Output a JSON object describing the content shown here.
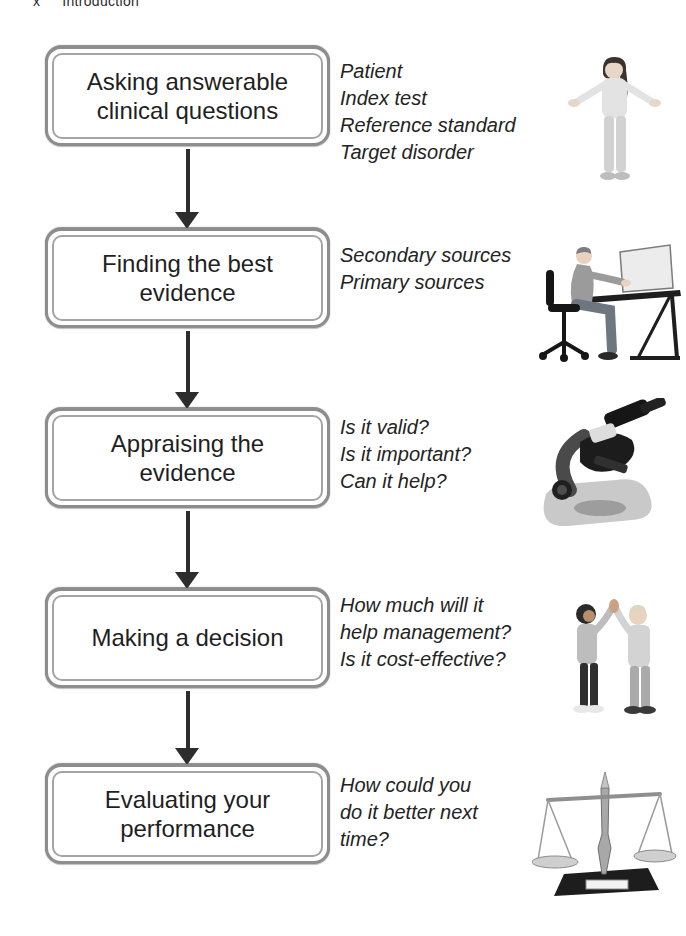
{
  "page": {
    "header": {
      "page_number": "x",
      "title": "Introduction"
    }
  },
  "flowchart": {
    "steps": [
      {
        "label": "Asking answerable\nclinical questions",
        "note": "Patient\nIndex test\nReference standard\nTarget disorder",
        "image": "girl-shrugging"
      },
      {
        "label": "Finding the best\nevidence",
        "note": "Secondary sources\nPrimary sources",
        "image": "person-at-computer"
      },
      {
        "label": "Appraising the\nevidence",
        "note": "Is it valid?\nIs it important?\nCan it help?",
        "image": "microscope"
      },
      {
        "label": "Making a decision",
        "note": "How much will it\nhelp management?\nIs it cost-effective?",
        "image": "children-high-five"
      },
      {
        "label": "Evaluating your\nperformance",
        "note": "How could you\ndo it better next\ntime?",
        "image": "balance-scale"
      }
    ]
  },
  "colors": {
    "background": "#ffffff",
    "box_border_outer": "#8d8d8d",
    "box_border_inner": "#a4a4a4",
    "arrow": "#2d2d2d",
    "text": "#1f1f1f"
  }
}
